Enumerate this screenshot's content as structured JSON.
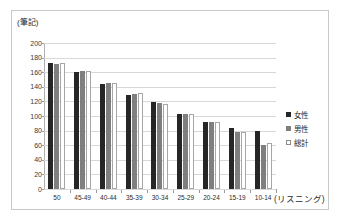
{
  "chart_data": {
    "type": "bar",
    "title": "",
    "subtitle": "",
    "ylabel": "(筆記)",
    "xlabel": "(リスニング)",
    "categories": [
      "50",
      "45-49",
      "40-44",
      "35-39",
      "30-34",
      "25-29",
      "20-24",
      "15-19",
      "10-14"
    ],
    "series": [
      {
        "name": "女性",
        "values": [
          173,
          160,
          144,
          129,
          119,
          103,
          92,
          83,
          80
        ]
      },
      {
        "name": "男性",
        "values": [
          171,
          161,
          145,
          130,
          118,
          103,
          92,
          78,
          60
        ]
      },
      {
        "name": "総計",
        "values": [
          172,
          161,
          145,
          131,
          117,
          103,
          92,
          78,
          63
        ]
      }
    ],
    "ylim": [
      0,
      200
    ],
    "yticks": [
      0,
      20,
      40,
      60,
      80,
      100,
      120,
      140,
      160,
      180,
      200
    ],
    "ytick_labels": [
      "0",
      "20",
      "40",
      "60",
      "80",
      "100",
      "120",
      "140",
      "160",
      "180",
      "200"
    ],
    "grid": true,
    "legend_position": "right",
    "colors": {
      "female": "#262626",
      "male": "#7f7f7f",
      "total": "#ffffff",
      "total_border": "#a6a6a6",
      "gridline": "#d8d8d8",
      "axis": "#9a9a9a",
      "frame": "#c9c9c9",
      "text": "#2b2b2b"
    }
  },
  "legend": {
    "items": [
      {
        "label": "女性",
        "swatch": "female"
      },
      {
        "label": "男性",
        "swatch": "male"
      },
      {
        "label": "総計",
        "swatch": "total"
      }
    ]
  }
}
